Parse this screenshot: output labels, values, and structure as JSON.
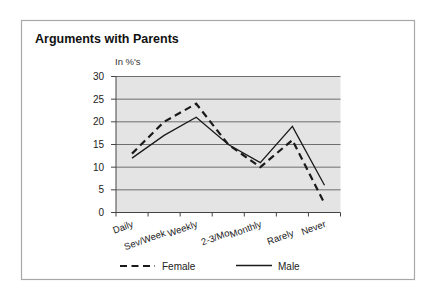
{
  "chart_data": {
    "type": "line",
    "title": "Arguments with Parents",
    "subtitle": "",
    "xlabel": "",
    "ylabel": "In %'s",
    "categories": [
      "Daily",
      "Sev/Week",
      "Weekly",
      "2-3/Mo",
      "Monthly",
      "Rarely",
      "Never"
    ],
    "series": [
      {
        "name": "Female",
        "style": "dashed",
        "values": [
          13,
          20,
          24,
          15,
          10,
          16,
          2
        ]
      },
      {
        "name": "Male",
        "style": "solid",
        "values": [
          12,
          17,
          21,
          15,
          11,
          19,
          6
        ]
      }
    ],
    "ylim": [
      0,
      30
    ],
    "yticks": [
      0,
      5,
      10,
      15,
      20,
      25,
      30
    ],
    "grid": true,
    "legend_position": "bottom"
  },
  "colors": {
    "plot_background": "#e4e4e4",
    "gridline": "#6e6e6e",
    "line": "#1a1a1a",
    "frame": "#a8a8a8"
  }
}
